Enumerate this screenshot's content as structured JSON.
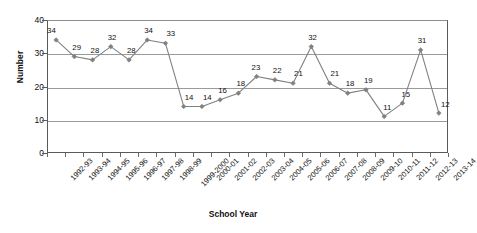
{
  "chart_data": {
    "type": "line",
    "title": "",
    "xlabel": "School Year",
    "ylabel": "Number",
    "ylim": [
      0,
      40
    ],
    "yticks": [
      0,
      10,
      20,
      30,
      40
    ],
    "grid": true,
    "legend": "none",
    "marker": "diamond",
    "series_color": "#808080",
    "categories": [
      "1992-93",
      "1993-94",
      "1994-95",
      "1995-96",
      "1996-97",
      "1997-98",
      "1998-99",
      "1999-2000",
      "2000-01",
      "2001-02",
      "2002-03",
      "2003-04",
      "2004-05",
      "2005-06",
      "2006-07",
      "2007-08",
      "2008-09",
      "2009-10",
      "2010-11",
      "2011-12",
      "2012-13",
      "2013-14"
    ],
    "values": [
      34,
      29,
      28,
      32,
      28,
      34,
      33,
      14,
      14,
      16,
      18,
      23,
      22,
      21,
      32,
      21,
      18,
      19,
      11,
      15,
      31,
      12
    ],
    "data_labels": [
      "34",
      "29",
      "28",
      "32",
      "28",
      "34",
      "33",
      "14",
      "14",
      "16",
      "18",
      "23",
      "22",
      "21",
      "32",
      "21",
      "18",
      "19",
      "11",
      "15",
      "31",
      "12"
    ]
  },
  "axes": {
    "y_title": "Number",
    "x_title": "School Year",
    "y_tick_labels": [
      "0",
      "10",
      "20",
      "30",
      "40"
    ]
  },
  "colors": {
    "series": "#808080",
    "grid": "#9a9a9a",
    "axis": "#5a5a5a",
    "text": "#111111",
    "background": "#ffffff"
  }
}
